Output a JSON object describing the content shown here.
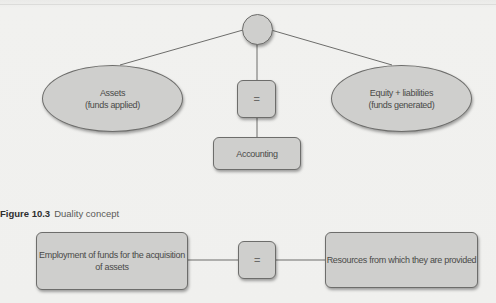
{
  "diagram_top": {
    "root_node": {
      "label": ""
    },
    "left_node": {
      "line1": "Assets",
      "line2": "(funds applied)"
    },
    "center_node": {
      "label": "="
    },
    "right_node": {
      "line1": "Equity + liabilities",
      "line2": "(funds generated)"
    },
    "bottom_node": {
      "label": "Accounting"
    }
  },
  "caption": {
    "figure_number": "Figure 10.3",
    "title": "Duality concept"
  },
  "diagram_bottom": {
    "left_box": {
      "line1": "Employment of funds for the acquisition",
      "line2": "of assets"
    },
    "equals_box": {
      "label": "="
    },
    "right_box": {
      "label": "Resources from which they are provided"
    }
  },
  "colors": {
    "background": "#efefed",
    "node_fill": "#cfcfcd",
    "node_border": "#6d6d6b",
    "line": "#6d6d6b",
    "text": "#4a4a48"
  }
}
